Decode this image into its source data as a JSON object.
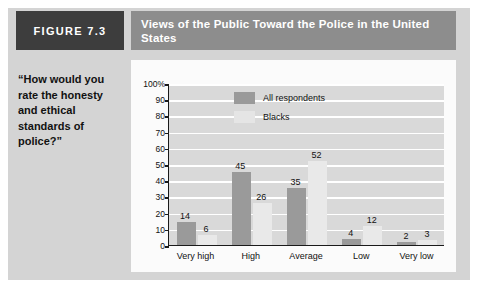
{
  "figure": {
    "tag": "FIGURE 7.3",
    "title": "Views of the Public Toward the Police in the United States",
    "quote": "“How would you rate the honesty and ethical standards of police?”"
  },
  "colors": {
    "tag_background": "#3d3d3d",
    "title_background": "#8d8d8d",
    "panel_background": "#d4d4d4",
    "plot_background": "#d9d9d9",
    "series_all_respondents": "#9a9a9a",
    "series_blacks": "#e9e9e9",
    "gridline": "#ffffff",
    "axis": "#1a1a1a"
  },
  "chart_data": {
    "type": "bar",
    "title": "Views of the Public Toward the Police in the United States",
    "xlabel": "",
    "ylabel": "",
    "ylim": [
      0,
      100
    ],
    "yticks": [
      0,
      10,
      20,
      30,
      40,
      50,
      60,
      70,
      80,
      90,
      100
    ],
    "ytick_labels": [
      "0",
      "10",
      "20",
      "30",
      "40",
      "50",
      "60",
      "70",
      "80",
      "90",
      "100%"
    ],
    "grid": true,
    "legend_position": "top-left-inside",
    "categories": [
      "Very high",
      "High",
      "Average",
      "Low",
      "Very low"
    ],
    "series": [
      {
        "name": "All respondents",
        "values": [
          14,
          45,
          35,
          4,
          2
        ]
      },
      {
        "name": "Blacks",
        "values": [
          6,
          26,
          52,
          12,
          3
        ]
      }
    ]
  }
}
